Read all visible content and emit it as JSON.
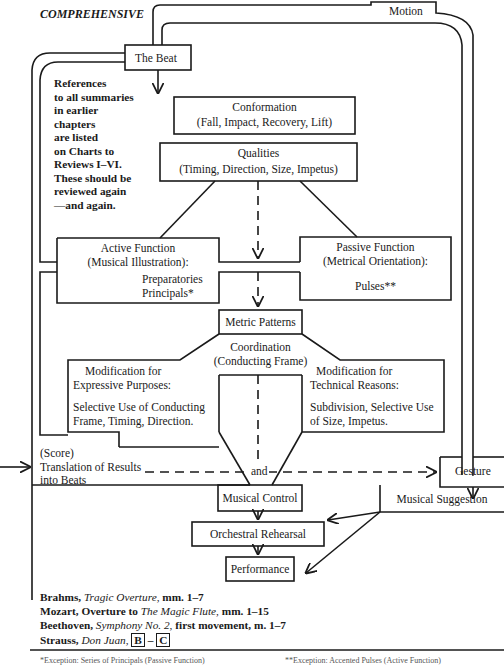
{
  "header": {
    "title": "COMPREHENSIVE"
  },
  "side_note": {
    "lines": [
      "References",
      "to all summaries",
      "in earlier",
      "chapters",
      "are listed",
      "on Charts to",
      "Reviews I–VI.",
      "These should be",
      "reviewed again",
      "—and again."
    ]
  },
  "nodes": {
    "motion": "Motion",
    "beat": "The Beat",
    "conformation": {
      "title": "Conformation",
      "detail": "(Fall, Impact, Recovery, Lift)"
    },
    "qualities": {
      "title": "Qualities",
      "detail": "(Timing, Direction, Size, Impetus)"
    },
    "active": {
      "title": "Active Function",
      "detail": "(Musical Illustration):",
      "items": [
        "Preparatories",
        "Principals*"
      ]
    },
    "passive": {
      "title": "Passive Function",
      "detail": "(Metrical Orientation):",
      "items": [
        "Pulses**"
      ]
    },
    "metric": "Metric Patterns",
    "coordination": {
      "title": "Coordination",
      "detail": "(Conducting Frame)"
    },
    "expressive": {
      "title": "Modification for",
      "subtitle": "Expressive Purposes:",
      "lines": [
        "Selective Use  of Conducting",
        "Frame, Timing,  Direction."
      ]
    },
    "technical": {
      "title": "Modification for",
      "subtitle": "Technical Reasons:",
      "lines": [
        "Subdivision,  Selective Use",
        "of Size,  Impetus."
      ]
    },
    "score": {
      "lines": [
        "(Score)",
        "Translation of Results",
        "into Beats"
      ]
    },
    "and": "and",
    "gesture": "Gesture",
    "musical_control": "Musical Control",
    "musical_suggestion": "Musical Suggestion",
    "rehearsal": "Orchestral Rehearsal",
    "performance": "Performance"
  },
  "references": [
    {
      "composer": "Brahms,",
      "work": "Tragic Overture,",
      "rest": "mm. 1–7"
    },
    {
      "composer": "Mozart, Overture to",
      "work": "The Magic Flute,",
      "rest": "mm. 1–15"
    },
    {
      "composer": "Beethoven,",
      "work": "Symphony No. 2,",
      "rest": "first movement, m. 1–7"
    },
    {
      "composer": "Strauss,",
      "work": "Don Juan,",
      "mark_a": "B",
      "dash": "–",
      "mark_b": "C"
    }
  ],
  "footnotes": {
    "left": "*Exception: Series of Principals (Passive Function)",
    "right": "**Exception: Accented Pulses (Active Function)"
  }
}
